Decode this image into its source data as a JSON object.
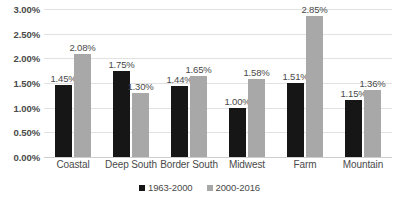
{
  "chart_data": {
    "type": "bar",
    "title": "",
    "subtitle": "",
    "xlabel": "",
    "ylabel": "",
    "categories": [
      "Coastal",
      "Deep South",
      "Border South",
      "Midwest",
      "Farm",
      "Mountain"
    ],
    "series": [
      {
        "name": "1963-2000",
        "color": "#161616",
        "values": [
          1.45,
          1.75,
          1.44,
          1.0,
          1.51,
          1.15
        ],
        "labels": [
          "1.45%",
          "1.75%",
          "1.44%",
          "1.00%",
          "1.51%",
          "1.15%"
        ]
      },
      {
        "name": "2000-2016",
        "color": "#a8a8a8",
        "values": [
          2.08,
          1.3,
          1.65,
          1.58,
          2.85,
          1.36
        ],
        "labels": [
          "2.08%",
          "1.30%",
          "1.65%",
          "1.58%",
          "2.85%",
          "1.36%"
        ]
      }
    ],
    "ylim": [
      0,
      3.0
    ],
    "ytick_values": [
      0.0,
      0.5,
      1.0,
      1.5,
      2.0,
      2.5,
      3.0
    ],
    "ytick_labels": [
      "0.00%",
      "0.50%",
      "1.00%",
      "1.50%",
      "2.00%",
      "2.50%",
      "3.00%"
    ],
    "grid": true,
    "grid_axis": "y",
    "legend_position": "bottom-center",
    "value_labels_shown": true
  },
  "colors": {
    "series_1963_2000": "#161616",
    "series_2000_2016": "#a8a8a8",
    "gridline": "#e2e2e2",
    "axis_text": "#4a4a4a",
    "background": "#ffffff"
  }
}
